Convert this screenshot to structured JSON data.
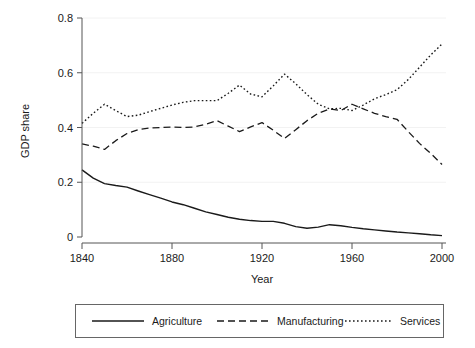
{
  "chart_data": {
    "type": "line",
    "title": "",
    "xlabel": "Year",
    "ylabel": "GDP share",
    "xlim": [
      1840,
      2000
    ],
    "ylim": [
      0,
      0.8
    ],
    "grid": false,
    "legend_position": "bottom",
    "xticks": [
      "1840",
      "1880",
      "1920",
      "1960",
      "2000"
    ],
    "xtick_values": [
      1840,
      1880,
      1920,
      1960,
      2000
    ],
    "yticks": [
      "0",
      "0.2",
      "0.4",
      "0.6",
      "0.8"
    ],
    "ytick_values": [
      0,
      0.2,
      0.4,
      0.6,
      0.8
    ],
    "x": [
      1840,
      1845,
      1850,
      1855,
      1860,
      1865,
      1870,
      1875,
      1880,
      1885,
      1890,
      1895,
      1900,
      1905,
      1910,
      1915,
      1920,
      1925,
      1930,
      1935,
      1940,
      1945,
      1950,
      1955,
      1960,
      1965,
      1970,
      1975,
      1980,
      1985,
      1990,
      1995,
      2000
    ],
    "series": [
      {
        "name": "Agriculture",
        "style": "solid",
        "color": "#1a1a1a",
        "values": [
          0.245,
          0.215,
          0.195,
          0.188,
          0.182,
          0.168,
          0.155,
          0.142,
          0.128,
          0.118,
          0.105,
          0.092,
          0.082,
          0.072,
          0.065,
          0.06,
          0.057,
          0.057,
          0.05,
          0.038,
          0.032,
          0.036,
          0.045,
          0.041,
          0.035,
          0.03,
          0.026,
          0.022,
          0.018,
          0.015,
          0.012,
          0.008,
          0.005
        ]
      },
      {
        "name": "Manufacturing",
        "style": "dashed",
        "color": "#1a1a1a",
        "values": [
          0.34,
          0.332,
          0.32,
          0.352,
          0.378,
          0.392,
          0.398,
          0.4,
          0.402,
          0.4,
          0.402,
          0.412,
          0.425,
          0.405,
          0.385,
          0.402,
          0.418,
          0.39,
          0.36,
          0.392,
          0.425,
          0.452,
          0.468,
          0.462,
          0.485,
          0.468,
          0.452,
          0.44,
          0.43,
          0.385,
          0.342,
          0.305,
          0.265
        ]
      },
      {
        "name": "Services",
        "style": "dotted",
        "color": "#1a1a1a",
        "values": [
          0.415,
          0.452,
          0.485,
          0.462,
          0.44,
          0.445,
          0.458,
          0.47,
          0.482,
          0.492,
          0.498,
          0.498,
          0.498,
          0.525,
          0.555,
          0.522,
          0.512,
          0.552,
          0.595,
          0.56,
          0.52,
          0.485,
          0.468,
          0.47,
          0.462,
          0.482,
          0.505,
          0.52,
          0.538,
          0.575,
          0.62,
          0.665,
          0.705
        ]
      }
    ]
  },
  "legend": {
    "items": [
      {
        "label": "Agriculture",
        "style": "solid"
      },
      {
        "label": "Manufacturing",
        "style": "dashed"
      },
      {
        "label": "Services",
        "style": "dotted"
      }
    ]
  }
}
